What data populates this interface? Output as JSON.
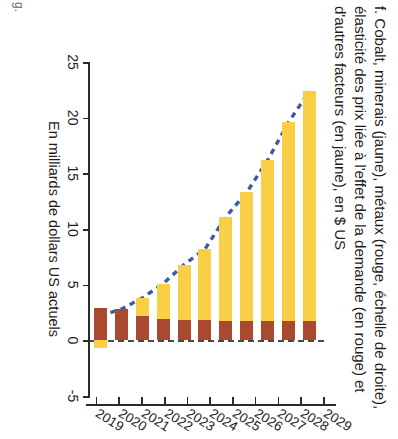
{
  "caption": "f. Cobalt, minerais (jaune), métaux (rouge, échelle de droite), élasticité des prix liée à l'effet de la demande (en rouge) et d'autres facteurs (en jaune), en $ US",
  "axis": {
    "value_axis_title": "En milliards de dollars US actuels",
    "value_ticks": [
      "25",
      "20",
      "15",
      "10",
      "5",
      "0",
      "-5"
    ],
    "category_ticks": [
      "2019",
      "2020",
      "2021",
      "2022",
      "2023",
      "2024",
      "2025",
      "2026",
      "2027",
      "2028",
      "2029"
    ]
  },
  "colors": {
    "yellow": "#f9cf45",
    "red": "#a9492f",
    "trend_line": "#3b5ba5",
    "axis": "#2b2b2b",
    "zero_line": "#4a4a4a"
  },
  "chart_data": {
    "type": "bar",
    "title": "f. Cobalt, minerais (jaune), métaux (rouge, échelle de droite), élasticité des prix liée à l'effet de la demande (en rouge) et d'autres facteurs (en jaune), en $ US",
    "xlabel": "",
    "ylabel": "En milliards de dollars US actuels",
    "orientation": "horizontal-stacked",
    "stacked": true,
    "categories": [
      "2019",
      "2020",
      "2021",
      "2022",
      "2023",
      "2024",
      "2025",
      "2026",
      "2027",
      "2028",
      "2029"
    ],
    "series": [
      {
        "name": "Élasticité des prix liée à l'effet de la demande (en rouge)",
        "color": "#a9492f",
        "values": [
          2.9,
          2.8,
          2.2,
          1.9,
          1.8,
          1.8,
          1.7,
          1.7,
          1.7,
          1.7,
          1.7
        ]
      },
      {
        "name": "Autres facteurs (en jaune)",
        "color": "#f9cf45",
        "values": [
          -0.7,
          0.0,
          1.6,
          3.2,
          5.0,
          6.4,
          9.4,
          11.6,
          14.5,
          17.9,
          20.7
        ]
      }
    ],
    "totals": [
      2.2,
      2.8,
      3.8,
      5.1,
      6.8,
      8.2,
      11.1,
      13.3,
      16.2,
      19.6,
      22.4
    ],
    "trend_line": {
      "name": "Total (ligne pointillée)",
      "color": "#3b5ba5",
      "style": "dashed",
      "values": [
        2.2,
        2.8,
        3.8,
        5.1,
        6.8,
        8.2,
        11.1,
        13.3,
        16.2,
        19.6,
        22.4
      ]
    },
    "ylim": [
      -5,
      25
    ],
    "value_tick_values": [
      25,
      20,
      15,
      10,
      5,
      0,
      -5
    ],
    "grid": false,
    "legend": "in-caption"
  },
  "corner_mark": "g."
}
